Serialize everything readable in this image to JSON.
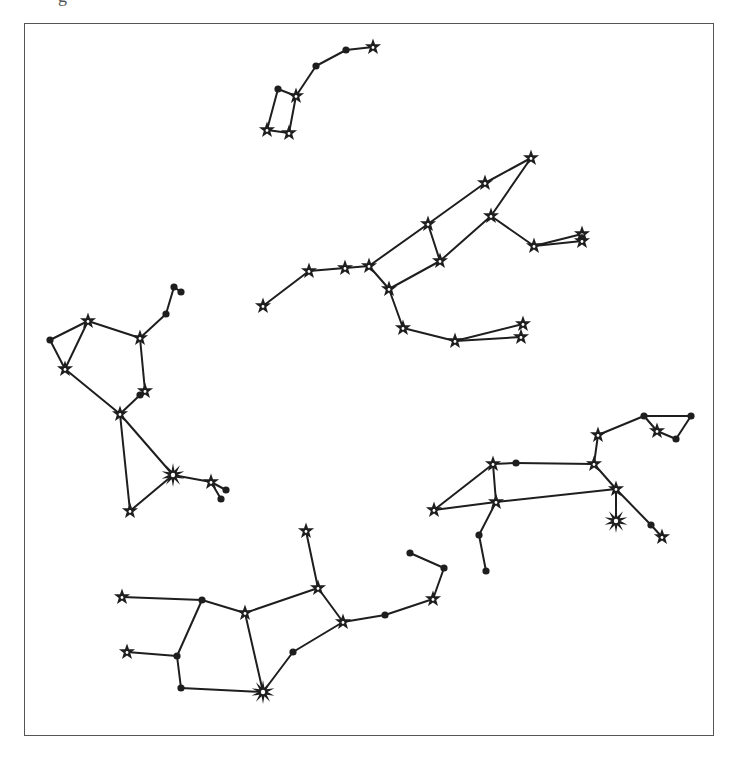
{
  "figure": {
    "top_glyph": "g",
    "frame": {
      "x": 24,
      "y": 23,
      "width": 690,
      "height": 713,
      "border_color": "#555555"
    },
    "colors": {
      "line": "#1e1e1e",
      "background": "#ffffff"
    },
    "constellations": [
      {
        "name": "little-dipper",
        "nodes": [
          {
            "x": 373,
            "y": 47,
            "type": "star5"
          },
          {
            "x": 346,
            "y": 50,
            "type": "dot"
          },
          {
            "x": 316,
            "y": 66,
            "type": "dot"
          },
          {
            "x": 296,
            "y": 96,
            "type": "star5"
          },
          {
            "x": 278,
            "y": 89,
            "type": "dot"
          },
          {
            "x": 267,
            "y": 130,
            "type": "star5"
          },
          {
            "x": 289,
            "y": 133,
            "type": "star5"
          }
        ],
        "edges": [
          [
            0,
            1
          ],
          [
            1,
            2
          ],
          [
            2,
            3
          ],
          [
            3,
            4
          ],
          [
            4,
            5
          ],
          [
            5,
            6
          ],
          [
            6,
            3
          ]
        ]
      },
      {
        "name": "ursa-major",
        "nodes": [
          {
            "x": 263,
            "y": 306,
            "type": "star5"
          },
          {
            "x": 309,
            "y": 271,
            "type": "star5"
          },
          {
            "x": 345,
            "y": 268,
            "type": "star5"
          },
          {
            "x": 369,
            "y": 266,
            "type": "star5"
          },
          {
            "x": 428,
            "y": 224,
            "type": "star5"
          },
          {
            "x": 440,
            "y": 261,
            "type": "star5"
          },
          {
            "x": 389,
            "y": 289,
            "type": "star5"
          },
          {
            "x": 485,
            "y": 183,
            "type": "star5"
          },
          {
            "x": 531,
            "y": 158,
            "type": "star5"
          },
          {
            "x": 491,
            "y": 216,
            "type": "star5"
          },
          {
            "x": 534,
            "y": 246,
            "type": "star5"
          },
          {
            "x": 582,
            "y": 234,
            "type": "star5"
          },
          {
            "x": 582,
            "y": 241,
            "type": "star5"
          },
          {
            "x": 403,
            "y": 328,
            "type": "star5"
          },
          {
            "x": 455,
            "y": 341,
            "type": "star5"
          },
          {
            "x": 523,
            "y": 324,
            "type": "star5"
          },
          {
            "x": 521,
            "y": 337,
            "type": "star5"
          }
        ],
        "edges": [
          [
            0,
            1
          ],
          [
            1,
            2
          ],
          [
            2,
            3
          ],
          [
            3,
            4
          ],
          [
            4,
            5
          ],
          [
            5,
            6
          ],
          [
            6,
            3
          ],
          [
            4,
            7
          ],
          [
            7,
            8
          ],
          [
            8,
            9
          ],
          [
            9,
            5
          ],
          [
            9,
            10
          ],
          [
            10,
            11
          ],
          [
            10,
            12
          ],
          [
            6,
            13
          ],
          [
            13,
            14
          ],
          [
            14,
            15
          ],
          [
            14,
            16
          ]
        ]
      },
      {
        "name": "hercules",
        "nodes": [
          {
            "x": 174,
            "y": 287,
            "type": "dot"
          },
          {
            "x": 181,
            "y": 292,
            "type": "dot"
          },
          {
            "x": 166,
            "y": 314,
            "type": "dot"
          },
          {
            "x": 140,
            "y": 338,
            "type": "star5"
          },
          {
            "x": 88,
            "y": 321,
            "type": "star5"
          },
          {
            "x": 50,
            "y": 340,
            "type": "dot"
          },
          {
            "x": 65,
            "y": 369,
            "type": "star5"
          },
          {
            "x": 145,
            "y": 391,
            "type": "star5"
          },
          {
            "x": 140,
            "y": 395,
            "type": "dot"
          },
          {
            "x": 120,
            "y": 414,
            "type": "star5"
          },
          {
            "x": 173,
            "y": 475,
            "type": "star8"
          },
          {
            "x": 211,
            "y": 482,
            "type": "star5"
          },
          {
            "x": 226,
            "y": 490,
            "type": "dot"
          },
          {
            "x": 221,
            "y": 499,
            "type": "dot"
          },
          {
            "x": 130,
            "y": 511,
            "type": "star5"
          }
        ],
        "edges": [
          [
            0,
            1
          ],
          [
            0,
            2
          ],
          [
            2,
            3
          ],
          [
            3,
            4
          ],
          [
            4,
            5
          ],
          [
            5,
            6
          ],
          [
            6,
            4
          ],
          [
            6,
            9
          ],
          [
            3,
            7
          ],
          [
            7,
            8
          ],
          [
            8,
            9
          ],
          [
            9,
            10
          ],
          [
            10,
            11
          ],
          [
            11,
            12
          ],
          [
            11,
            13
          ],
          [
            9,
            14
          ],
          [
            14,
            10
          ]
        ]
      },
      {
        "name": "leo",
        "nodes": [
          {
            "x": 434,
            "y": 510,
            "type": "star5"
          },
          {
            "x": 493,
            "y": 464,
            "type": "star5"
          },
          {
            "x": 516,
            "y": 463,
            "type": "dot"
          },
          {
            "x": 594,
            "y": 464,
            "type": "star5"
          },
          {
            "x": 598,
            "y": 435,
            "type": "star5"
          },
          {
            "x": 644,
            "y": 416,
            "type": "dot"
          },
          {
            "x": 691,
            "y": 416,
            "type": "dot"
          },
          {
            "x": 676,
            "y": 439,
            "type": "dot"
          },
          {
            "x": 657,
            "y": 431,
            "type": "star5"
          },
          {
            "x": 496,
            "y": 502,
            "type": "star5"
          },
          {
            "x": 616,
            "y": 489,
            "type": "star5"
          },
          {
            "x": 616,
            "y": 521,
            "type": "star8"
          },
          {
            "x": 651,
            "y": 525,
            "type": "dot"
          },
          {
            "x": 662,
            "y": 537,
            "type": "star5"
          },
          {
            "x": 479,
            "y": 535,
            "type": "dot"
          },
          {
            "x": 486,
            "y": 571,
            "type": "dot"
          }
        ],
        "edges": [
          [
            0,
            1
          ],
          [
            1,
            2
          ],
          [
            2,
            3
          ],
          [
            3,
            4
          ],
          [
            4,
            5
          ],
          [
            5,
            6
          ],
          [
            6,
            7
          ],
          [
            7,
            8
          ],
          [
            8,
            5
          ],
          [
            1,
            9
          ],
          [
            0,
            9
          ],
          [
            9,
            10
          ],
          [
            3,
            10
          ],
          [
            10,
            11
          ],
          [
            10,
            12
          ],
          [
            12,
            13
          ],
          [
            9,
            14
          ],
          [
            14,
            15
          ]
        ]
      },
      {
        "name": "virgo",
        "nodes": [
          {
            "x": 122,
            "y": 597,
            "type": "star5"
          },
          {
            "x": 202,
            "y": 600,
            "type": "dot"
          },
          {
            "x": 245,
            "y": 613,
            "type": "star5"
          },
          {
            "x": 127,
            "y": 652,
            "type": "star5"
          },
          {
            "x": 177,
            "y": 656,
            "type": "dot"
          },
          {
            "x": 181,
            "y": 688,
            "type": "dot"
          },
          {
            "x": 263,
            "y": 692,
            "type": "star8"
          },
          {
            "x": 293,
            "y": 652,
            "type": "dot"
          },
          {
            "x": 343,
            "y": 622,
            "type": "star5"
          },
          {
            "x": 318,
            "y": 588,
            "type": "star5"
          },
          {
            "x": 306,
            "y": 531,
            "type": "star5"
          },
          {
            "x": 385,
            "y": 615,
            "type": "dot"
          },
          {
            "x": 433,
            "y": 599,
            "type": "star5"
          },
          {
            "x": 444,
            "y": 568,
            "type": "dot"
          },
          {
            "x": 410,
            "y": 553,
            "type": "dot"
          }
        ],
        "edges": [
          [
            0,
            1
          ],
          [
            1,
            2
          ],
          [
            2,
            9
          ],
          [
            9,
            10
          ],
          [
            9,
            8
          ],
          [
            1,
            4
          ],
          [
            3,
            4
          ],
          [
            4,
            5
          ],
          [
            5,
            6
          ],
          [
            2,
            6
          ],
          [
            6,
            7
          ],
          [
            7,
            8
          ],
          [
            8,
            11
          ],
          [
            11,
            12
          ],
          [
            12,
            13
          ],
          [
            13,
            14
          ]
        ]
      }
    ]
  }
}
